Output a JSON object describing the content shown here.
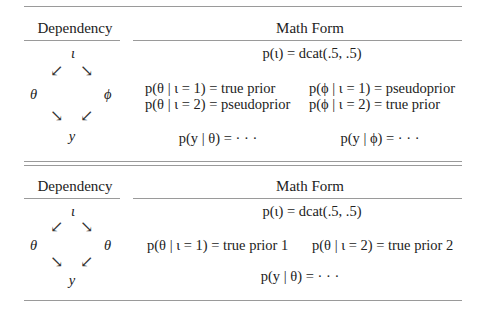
{
  "table1": {
    "header_dependency": "Dependency",
    "header_math": "Math Form",
    "graph": {
      "top": "ι",
      "left": "θ",
      "right": "ϕ",
      "bottom": "y",
      "arrow_down_left": "↙",
      "arrow_down_right": "↘"
    },
    "prior_index": "p(ι) = dcat(.5, .5)",
    "left_col": [
      "p(θ | ι = 1) = true prior",
      "p(θ | ι = 2) = pseudoprior"
    ],
    "right_col": [
      "p(ϕ | ι = 1) = pseudoprior",
      "p(ϕ | ι = 2) = true prior"
    ],
    "likelihood_left": "p(y | θ) = · · ·",
    "likelihood_right": "p(y | ϕ) = · · ·"
  },
  "table2": {
    "header_dependency": "Dependency",
    "header_math": "Math Form",
    "graph": {
      "top": "ι",
      "left": "θ",
      "right": "θ",
      "bottom": "y",
      "arrow_down_left": "↙",
      "arrow_down_right": "↘"
    },
    "prior_index": "p(ι) = dcat(.5, .5)",
    "left_col": [
      "p(θ | ι = 1) = true prior 1"
    ],
    "right_col": [
      "p(θ | ι = 2) = true prior 2"
    ],
    "likelihood": "p(y | θ) = · · ·"
  }
}
